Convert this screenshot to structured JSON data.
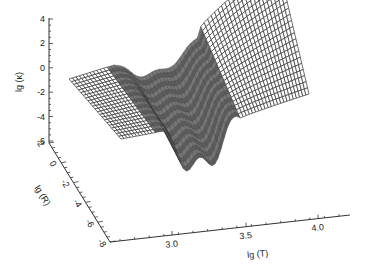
{
  "chart_data": {
    "type": "surface3d",
    "title": "",
    "axes": {
      "z": {
        "label": "lg (κ)",
        "ticks": [
          4,
          2,
          0,
          -2,
          -4,
          -6
        ],
        "range": [
          -6,
          4
        ]
      },
      "y": {
        "label": "lg (R)",
        "ticks": [
          2,
          0,
          -2,
          -4,
          -6,
          -8
        ],
        "range": [
          -8,
          2
        ]
      },
      "x": {
        "label": "lg (T)",
        "ticks": [
          3.0,
          3.5,
          4.0
        ],
        "tick_labels": [
          "3.0",
          "3.5",
          "4.0"
        ],
        "range": [
          2.6,
          4.1
        ]
      }
    },
    "grid": false,
    "legend": null,
    "surface_description": "Wireframe mesh of opacity lg(κ) over lg(T) and lg(R); flat plateau near lg κ≈-1 at low T, a deep oscillating trough around lg T≈3.2–3.5 dropping to about -6, then rising steeply to about 4 at high T and high R.",
    "styling": {
      "mesh_color": "#333333",
      "dense_region_fill": "#6a6a6a",
      "background": "#ffffff"
    }
  },
  "labels": {
    "z_axis": "lg (κ)",
    "y_axis": "lg (R)",
    "x_axis": "lg (T)",
    "z_ticks": [
      "4",
      "2",
      "0",
      "-2",
      "-4",
      "-6"
    ],
    "y_ticks": [
      "2",
      "0",
      "-2",
      "-4",
      "-6",
      "-8"
    ],
    "x_ticks": [
      "3.0",
      "3.5",
      "4.0"
    ]
  }
}
